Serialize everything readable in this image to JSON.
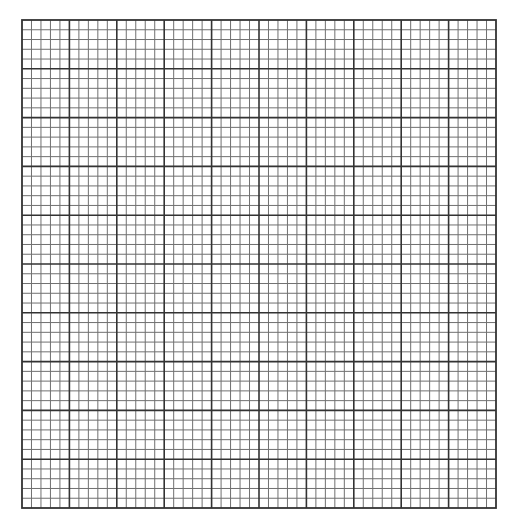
{
  "grid": {
    "left": 21,
    "top": 19,
    "width": 474,
    "height": 488,
    "major_columns": 10,
    "major_rows": 10,
    "minor_per_major": 5,
    "colors": {
      "background": "#ffffff",
      "minor_line": "#707070",
      "major_line": "#333333",
      "border": "#333333"
    },
    "line_widths": {
      "minor": 1,
      "major": 1.6,
      "border": 1.8
    }
  }
}
